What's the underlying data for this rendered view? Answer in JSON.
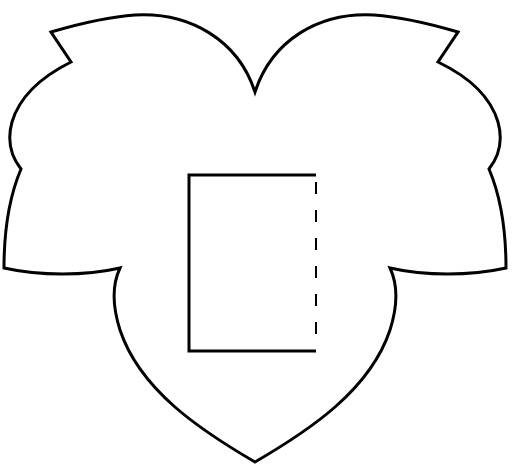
{
  "figure": {
    "colors": {
      "background": "#ffffff",
      "stroke": "#000000"
    },
    "outline": {
      "shape": "leaf-heart",
      "stroke_width": 3
    },
    "rectangle": {
      "x": 189,
      "y": 175,
      "width": 127,
      "height": 176,
      "stroke_width": 3,
      "dashed_side": "right"
    }
  }
}
